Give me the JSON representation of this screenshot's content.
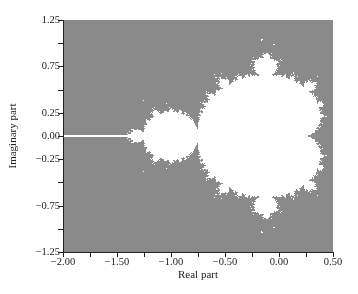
{
  "chart_data": {
    "type": "heatmap",
    "title": "",
    "xlabel": "Real part",
    "ylabel": "Imaginary part",
    "xlim": [
      -2.0,
      0.5
    ],
    "ylim": [
      -1.25,
      1.25
    ],
    "x_ticks": [
      {
        "value": -2.0,
        "label": "−2.00"
      },
      {
        "value": -1.75,
        "label": ""
      },
      {
        "value": -1.5,
        "label": "−1.50"
      },
      {
        "value": -1.25,
        "label": ""
      },
      {
        "value": -1.0,
        "label": "−1.00"
      },
      {
        "value": -0.75,
        "label": ""
      },
      {
        "value": -0.5,
        "label": "−0.50"
      },
      {
        "value": -0.25,
        "label": ""
      },
      {
        "value": 0.0,
        "label": "0.00"
      },
      {
        "value": 0.25,
        "label": ""
      },
      {
        "value": 0.5,
        "label": "0.50"
      }
    ],
    "y_ticks": [
      {
        "value": 1.25,
        "label": "1.25"
      },
      {
        "value": 1.0,
        "label": ""
      },
      {
        "value": 0.75,
        "label": "0.75"
      },
      {
        "value": 0.5,
        "label": ""
      },
      {
        "value": 0.25,
        "label": "0.25"
      },
      {
        "value": 0.0,
        "label": "0.00"
      },
      {
        "value": -0.25,
        "label": "−0.25"
      },
      {
        "value": -0.5,
        "label": ""
      },
      {
        "value": -0.75,
        "label": "−0.75"
      },
      {
        "value": -1.0,
        "label": ""
      },
      {
        "value": -1.25,
        "label": "−1.25"
      }
    ],
    "set_color": "#ffffff",
    "background_color": "#8a8a8a",
    "max_iterations": 40,
    "grid": false,
    "legend": null
  }
}
